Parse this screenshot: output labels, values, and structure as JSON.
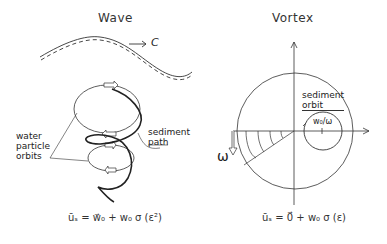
{
  "wave_panel": {
    "title": "Wave",
    "speed_label": "C",
    "labels": {
      "water_particle_orbits": [
        "water",
        "particle",
        "orbits"
      ],
      "sediment_path": [
        "sediment",
        "path"
      ]
    },
    "equation": "ūₛ = w⃗₀ + w₀ σ (ε²)"
  },
  "vortex_panel": {
    "title": "Vortex",
    "labels": {
      "sediment_orbit": [
        "sediment",
        "orbit"
      ],
      "radius": "w₀/ω",
      "omega": "ω"
    },
    "equation": "ūₛ = 0⃗ + w₀ σ (ε)"
  }
}
